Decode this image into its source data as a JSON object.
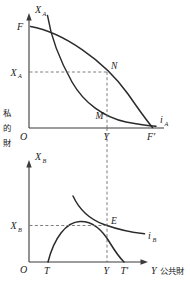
{
  "figure": {
    "background_color": "#ffffff",
    "ink_color": "#2b2b2b",
    "dash_color": "#6f6f6f"
  },
  "side_label": {
    "name": "private-goods-vertical-label",
    "characters": [
      "私",
      "的",
      "財"
    ],
    "text": "私的財"
  },
  "bottom_label": {
    "axis_symbol": "Y",
    "text": "公共財"
  },
  "upper_panel": {
    "name": "panel-A",
    "y_axis_label": {
      "base": "X",
      "sub": "A"
    },
    "origin_label": "O",
    "y_ticks": [
      {
        "label_base": "X",
        "label_sub": "A",
        "value_note": "tangency height of N"
      }
    ],
    "x_ticks": [
      {
        "label": "Y"
      },
      {
        "label": "F'"
      }
    ],
    "axis_top_label": "F",
    "points": [
      {
        "label": "N",
        "note": "tangency of indifference curve i_A with transformation curve"
      },
      {
        "label": "M",
        "note": "lower intersection on offer/consumption curve"
      }
    ],
    "curves": [
      {
        "name": "transformation-curve-FF",
        "label": "F–F'",
        "shape": "concave-decreasing"
      },
      {
        "name": "indifference-curve-iA",
        "label_base": "i",
        "label_sub": "A",
        "shape": "convex-steep-decreasing"
      }
    ]
  },
  "lower_panel": {
    "name": "panel-B",
    "y_axis_label": {
      "base": "X",
      "sub": "B"
    },
    "origin_label": "O",
    "y_ticks": [
      {
        "label_base": "X",
        "label_sub": "B",
        "value_note": "tangency height of E"
      }
    ],
    "x_ticks": [
      {
        "label": "T"
      },
      {
        "label": "Y"
      },
      {
        "label": "T'"
      }
    ],
    "points": [
      {
        "label": "E",
        "note": "tangency of indifference curve i_B with the hump curve"
      }
    ],
    "curves": [
      {
        "name": "residual-curve-TT",
        "label": "T–T'",
        "shape": "inverted-u-hump"
      },
      {
        "name": "indifference-curve-iB",
        "label_base": "i",
        "label_sub": "B",
        "shape": "convex-decreasing"
      }
    ]
  },
  "connector": {
    "name": "vertical-equilibrium-dashed-line",
    "at_x_label": "Y",
    "style": "dashed"
  }
}
